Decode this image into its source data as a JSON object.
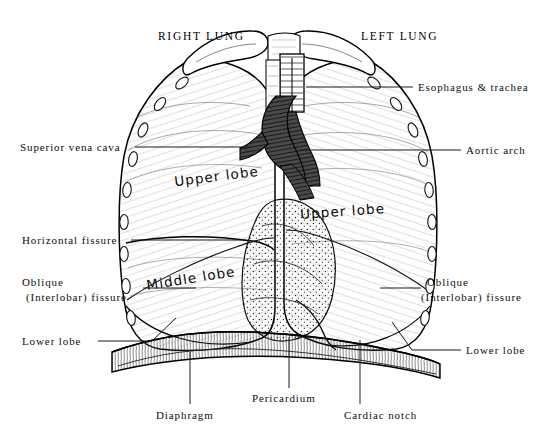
{
  "figure": {
    "title_left": "RIGHT LUNG",
    "title_right": "LEFT LUNG"
  },
  "inline_labels": {
    "right_upper_lobe": "Upper lobe",
    "right_middle_lobe": "Middle lobe",
    "left_upper_lobe": "Upper lobe"
  },
  "callouts": {
    "esophagus_trachea": "Esophagus & trachea",
    "aortic_arch": "Aortic arch",
    "superior_vena_cava": "Superior vena cava",
    "horizontal_fissure": "Horizontal fissure",
    "oblique_left_line1": "Oblique",
    "oblique_left_line2": "(Interlobar) fissure",
    "lower_lobe_left": "Lower lobe",
    "oblique_right_line1": "Oblique",
    "oblique_right_line2": "(Interlobar) fissure",
    "lower_lobe_right": "Lower lobe",
    "diaphragm": "Diaphragm",
    "pericardium": "Pericardium",
    "cardiac_notch": "Cardiac notch"
  },
  "colors": {
    "background": "#ffffff",
    "ink": "#000000",
    "label_ink": "#0d0d0d",
    "leader_line": "#1a1a1a"
  }
}
